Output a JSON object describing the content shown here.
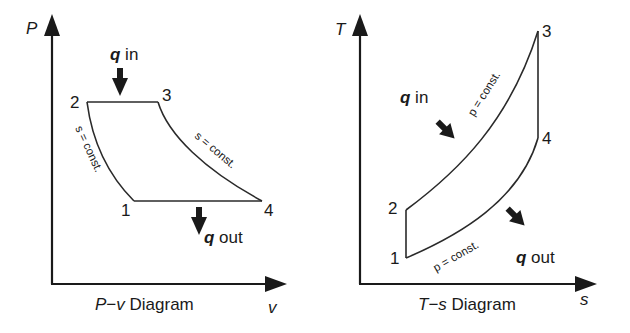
{
  "pv": {
    "title_left": "P",
    "title_dash": "−",
    "title_right": "v",
    "title_suffix": " Diagram",
    "y_axis_label": "P",
    "x_axis_label": "v",
    "points": {
      "p1": "1",
      "p2": "2",
      "p3": "3",
      "p4": "4"
    },
    "curve_labels": {
      "left": "s = const.",
      "right": "s = const."
    },
    "q_in": {
      "q": "q",
      "text": " in"
    },
    "q_out": {
      "q": "q",
      "text": " out"
    }
  },
  "ts": {
    "title_left": "T",
    "title_dash": "−",
    "title_right": "s",
    "title_suffix": " Diagram",
    "y_axis_label": "T",
    "x_axis_label": "s",
    "points": {
      "p1": "1",
      "p2": "2",
      "p3": "3",
      "p4": "4"
    },
    "curve_labels": {
      "upper": "p = const.",
      "lower": "p = const."
    },
    "q_in": {
      "q": "q",
      "text": " in"
    },
    "q_out": {
      "q": "q",
      "text": " out"
    }
  },
  "colors": {
    "ink": "#1a1a1a",
    "background": "#ffffff"
  }
}
